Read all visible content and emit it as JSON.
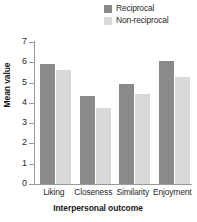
{
  "chart_data": {
    "type": "bar",
    "title": "",
    "xlabel": "Interpersonal outcome",
    "ylabel": "Mean value",
    "categories": [
      "Liking",
      "Closeness",
      "Similarity",
      "Enjoyment"
    ],
    "series": [
      {
        "name": "Reciprocal",
        "color": "#8a8a8a",
        "values": [
          5.9,
          4.35,
          4.95,
          6.05
        ]
      },
      {
        "name": "Non-reciprocal",
        "color": "#d9d9d9",
        "values": [
          5.6,
          3.75,
          4.45,
          5.3
        ]
      }
    ],
    "ylim": [
      0,
      7
    ],
    "yticks": [
      "0",
      "1",
      "2",
      "3",
      "4",
      "5",
      "6",
      "7"
    ],
    "grid": false,
    "legend_position": "top-right"
  },
  "legend": {
    "items": [
      {
        "label": "Reciprocal"
      },
      {
        "label": "Non-reciprocal"
      }
    ]
  }
}
